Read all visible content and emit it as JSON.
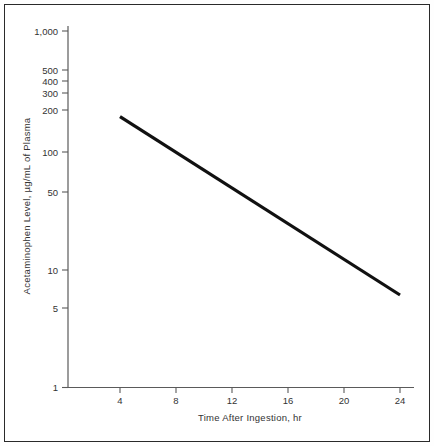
{
  "figure": {
    "kind": "semilog-plot",
    "border_color": "#2a2a2a",
    "background_color": "#ffffff"
  },
  "chart_data": {
    "type": "line",
    "title": "",
    "subtitle": "",
    "xlabel": "Time After Ingestion, hr",
    "ylabel": "Acetaminophen Level, µg/mL of Plasma",
    "yscale": "log",
    "xscale": "linear",
    "xlim": [
      0,
      25
    ],
    "ylim": [
      1,
      1000
    ],
    "grid": false,
    "legend": null,
    "xticks": [
      4,
      8,
      12,
      16,
      20,
      24
    ],
    "xtick_labels": [
      "4",
      "8",
      "12",
      "16",
      "20",
      "24"
    ],
    "yticks": [
      1,
      5,
      10,
      50,
      100,
      200,
      300,
      400,
      500,
      1000
    ],
    "ytick_labels": [
      "1",
      "5",
      "10",
      "50",
      "100",
      "200",
      "300",
      "400",
      "500",
      "1,000"
    ],
    "series": [
      {
        "name": "Treatment line",
        "x": [
          4,
          24
        ],
        "values": [
          190,
          6
        ],
        "color": "#111111",
        "linewidth": 3.2
      }
    ],
    "annotations": []
  },
  "labels": {
    "y_axis_title": "Acetaminophen Level, µg/mL of Plasma",
    "x_axis_title": "Time After Ingestion, hr",
    "y_1000": "1,000",
    "y_500": "500",
    "y_400": "400",
    "y_300": "300",
    "y_200": "200",
    "y_100": "100",
    "y_50": "50",
    "y_10": "10",
    "y_5": "5",
    "y_1": "1",
    "x_4": "4",
    "x_8": "8",
    "x_12": "12",
    "x_16": "16",
    "x_20": "20",
    "x_24": "24"
  }
}
